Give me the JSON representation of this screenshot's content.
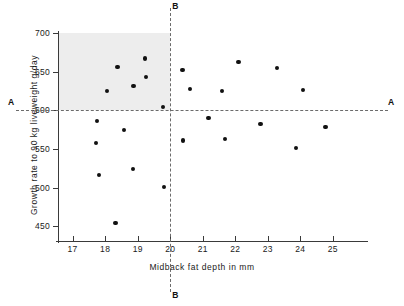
{
  "chart_data": {
    "type": "scatter",
    "title": "",
    "xlabel": "Midback fat depth in mm",
    "ylabel": "Growth rate to 90 kg liveweight g/day",
    "xlim": [
      16.55,
      25.9
    ],
    "ylim": [
      431,
      700
    ],
    "xticks": [
      17,
      18,
      19,
      20,
      21,
      22,
      23,
      24,
      25
    ],
    "yticks": [
      450,
      500,
      550,
      600,
      650,
      700
    ],
    "grid": false,
    "legend": null,
    "points": [
      {
        "x": 17.75,
        "y": 586
      },
      {
        "x": 17.72,
        "y": 558
      },
      {
        "x": 17.8,
        "y": 516
      },
      {
        "x": 18.05,
        "y": 625
      },
      {
        "x": 18.32,
        "y": 454
      },
      {
        "x": 18.38,
        "y": 656
      },
      {
        "x": 18.58,
        "y": 575
      },
      {
        "x": 18.85,
        "y": 524
      },
      {
        "x": 18.87,
        "y": 631
      },
      {
        "x": 19.22,
        "y": 667
      },
      {
        "x": 19.25,
        "y": 643
      },
      {
        "x": 19.78,
        "y": 604
      },
      {
        "x": 19.82,
        "y": 501
      },
      {
        "x": 20.38,
        "y": 652
      },
      {
        "x": 20.4,
        "y": 561
      },
      {
        "x": 20.62,
        "y": 628
      },
      {
        "x": 21.18,
        "y": 590
      },
      {
        "x": 21.6,
        "y": 625
      },
      {
        "x": 21.68,
        "y": 563
      },
      {
        "x": 22.1,
        "y": 662
      },
      {
        "x": 22.78,
        "y": 582
      },
      {
        "x": 23.28,
        "y": 655
      },
      {
        "x": 23.88,
        "y": 551
      },
      {
        "x": 24.08,
        "y": 626
      },
      {
        "x": 24.78,
        "y": 578
      }
    ],
    "reference_lines": [
      {
        "id": "A",
        "orientation": "horizontal",
        "value": 600,
        "style": "dashed",
        "label_left": "A",
        "label_right": "A"
      },
      {
        "id": "B",
        "orientation": "vertical",
        "value": 20,
        "style": "dashed",
        "label_top": "B",
        "label_bottom": "B"
      }
    ],
    "shaded_region": {
      "x_range": [
        16.55,
        20
      ],
      "y_range": [
        600,
        700
      ],
      "color": "#eaeaea",
      "description": "selection quadrant: fat depth below 20 mm and growth rate above 600 g/day"
    }
  },
  "axis": {
    "x_tick_labels": [
      "17",
      "18",
      "19",
      "20",
      "21",
      "22",
      "23",
      "24",
      "25"
    ],
    "y_tick_labels": [
      "450",
      "500",
      "550",
      "600",
      "650",
      "700"
    ],
    "x_title": "Midback fat depth in mm",
    "y_title": "Growth rate to 90 kg liveweight g/day"
  },
  "annotations": {
    "a_left": "A",
    "a_right": "A",
    "b_top": "B",
    "b_bottom": "B"
  },
  "colors": {
    "point": "#111111",
    "axis": "#3a3a3a",
    "dashed_line": "#6b6b6b",
    "shade": "#eaeaea",
    "background": "#ffffff"
  }
}
